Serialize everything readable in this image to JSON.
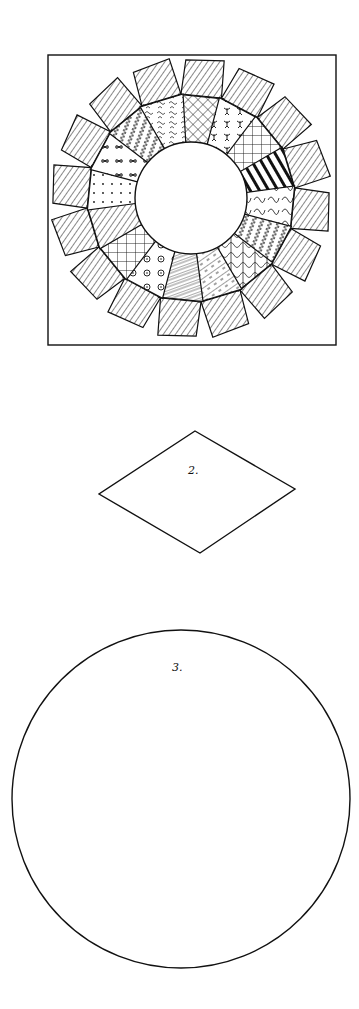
{
  "figure": {
    "block": {
      "frame": {
        "x": 48,
        "y": 55,
        "width": 288,
        "height": 290
      },
      "plate": {
        "cx": 191,
        "cy": 198,
        "outer_radius": 141,
        "inner_radius": 56,
        "petal_count": 16
      },
      "petal_patterns": [
        "crosshatch",
        "figures",
        "diamond-check",
        "bold-stripe",
        "curls",
        "zigzag-dots",
        "marbled",
        "dash-stripe",
        "scribble",
        "circles",
        "diamond-check",
        "hatch",
        "dots",
        "butterflies",
        "zigzag",
        "squiggle"
      ]
    },
    "templates": [
      {
        "id": "diamond",
        "label": "2.",
        "points": [
          [
            195,
            431
          ],
          [
            295,
            489
          ],
          [
            200,
            553
          ],
          [
            99,
            494
          ]
        ]
      },
      {
        "id": "circle",
        "label": "3.",
        "cx": 181,
        "cy": 799,
        "r": 169
      }
    ]
  },
  "colors": {
    "ink": "#111111",
    "paper": "#ffffff"
  }
}
